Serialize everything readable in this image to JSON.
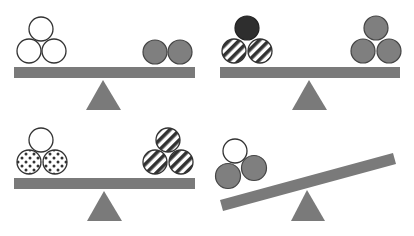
{
  "diagram": {
    "colors": {
      "beam": "#7a7a7a",
      "fulcrum": "#7a7a7a",
      "gray_ball": "#7f7f7f",
      "black_ball": "#2e2e2e",
      "white_ball": "#ffffff",
      "outline": "#333333",
      "stripe": "#333333",
      "dot": "#333333"
    },
    "panels": [
      {
        "id": "panel-1",
        "state": "balanced",
        "left": [
          "white",
          "white",
          "white"
        ],
        "right": [
          "gray",
          "gray"
        ]
      },
      {
        "id": "panel-2",
        "state": "balanced",
        "left": [
          "black",
          "striped",
          "striped"
        ],
        "right": [
          "gray",
          "gray",
          "gray"
        ]
      },
      {
        "id": "panel-3",
        "state": "balanced",
        "left": [
          "white",
          "dotted",
          "dotted"
        ],
        "right": [
          "striped",
          "striped",
          "striped"
        ]
      },
      {
        "id": "panel-4",
        "state": "tilted-left-down",
        "left": [
          "white",
          "gray",
          "gray"
        ],
        "right": []
      }
    ]
  }
}
